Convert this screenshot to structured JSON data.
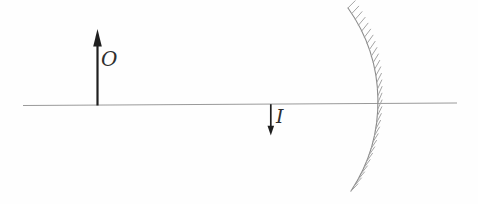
{
  "figure": {
    "object_label": "O",
    "image_label": "I"
  },
  "colors": {
    "background": "#fefefe",
    "axis": "#9a9a9a",
    "arrow": "#1f1f1f",
    "mirror": "#8a8a8a",
    "hatch": "#a5a5a5",
    "label": "#2f2f2f"
  }
}
